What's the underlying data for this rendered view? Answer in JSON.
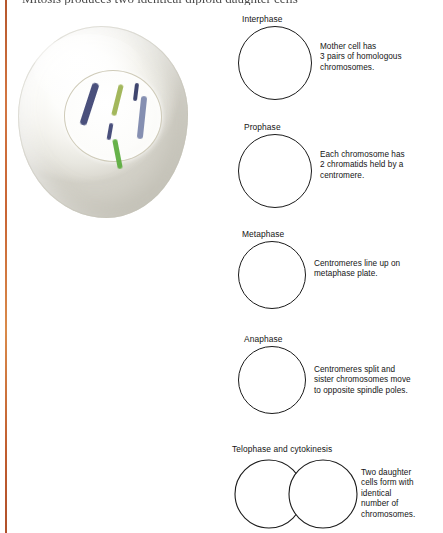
{
  "figure": {
    "top_clipped_heading": "Mitosis produces two identical diploid daughter cells",
    "accent_rule_color": "#c96534"
  },
  "cell_illustration": {
    "name": "mother-cell",
    "cell_fill": "#f5f4ef",
    "nucleus_border": "#cfcbb9",
    "chromosome_count": 6,
    "chromosome_pairs": 3,
    "chromosomes": [
      {
        "id": "chrom-navy-long",
        "color": "#3b4272",
        "left": 72,
        "top": 60,
        "length": 44,
        "width": 6.5,
        "rotate": 18
      },
      {
        "id": "chrom-navy-short",
        "color": "#3b4272",
        "left": 94,
        "top": 101,
        "length": 17,
        "width": 4.0,
        "rotate": 10
      },
      {
        "id": "chrom-olive-thin",
        "color": "#9cb24f",
        "left": 101,
        "top": 62,
        "length": 32,
        "width": 4.5,
        "rotate": 14
      },
      {
        "id": "chrom-navy-tick",
        "color": "#2f3663",
        "left": 120,
        "top": 61,
        "length": 18,
        "width": 4.2,
        "rotate": 7
      },
      {
        "id": "chrom-slate-long",
        "color": "#7b86ab",
        "left": 125,
        "top": 74,
        "length": 43,
        "width": 6.0,
        "rotate": 6
      },
      {
        "id": "chrom-green-horiz",
        "color": "#5aac3c",
        "left": 101,
        "top": 117,
        "length": 30,
        "width": 5.0,
        "rotate": -11
      }
    ]
  },
  "phases": [
    {
      "id": "interphase",
      "label": "Interphase",
      "label_left": 14,
      "label_top": 0,
      "shape": "circle",
      "circle_left": 10,
      "circle_top": 12,
      "circle_size": 74,
      "text": "Mother cell has\n3 pairs of homologous\nchromosomes.",
      "text_left": 92,
      "text_top": 28
    },
    {
      "id": "prophase",
      "label": "Prophase",
      "label_left": 16,
      "label_top": 108,
      "shape": "circle",
      "circle_left": 10,
      "circle_top": 120,
      "circle_size": 74,
      "text": "Each chromosome has\n2 chromatids held by a\ncentromere.",
      "text_left": 92,
      "text_top": 136
    },
    {
      "id": "metaphase",
      "label": "Metaphase",
      "label_left": 14,
      "label_top": 215,
      "shape": "circle",
      "circle_left": 10,
      "circle_top": 227,
      "circle_size": 68,
      "text": "Centromeres line up on\nmetaphase plate.",
      "text_left": 86,
      "text_top": 245
    },
    {
      "id": "anaphase",
      "label": "Anaphase",
      "label_left": 16,
      "label_top": 320,
      "shape": "circle",
      "circle_left": 10,
      "circle_top": 332,
      "circle_size": 68,
      "text": "Centromeres split and\nsister chromosomes move\nto opposite spindle poles.",
      "text_left": 86,
      "text_top": 351
    },
    {
      "id": "telophase",
      "label": "Telophase and cytokinesis",
      "label_left": 4,
      "label_top": 430,
      "shape": "double-circle",
      "circle_left": 6,
      "circle_top": 445,
      "circle_size": 68,
      "text": "Two daughter\ncells form with\nidentical\nnumber of\nchromosomes.",
      "text_left": 133,
      "text_top": 454
    }
  ]
}
